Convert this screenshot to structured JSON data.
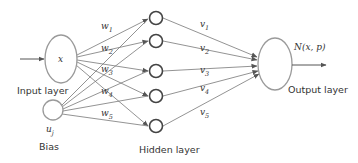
{
  "diagram": {
    "type": "neural-network",
    "input_layer": {
      "node_label": "x",
      "caption": "Input layer"
    },
    "bias": {
      "node_label": "u",
      "node_subscript": "j",
      "caption": "Bias"
    },
    "hidden_layer": {
      "caption": "Hidden layer",
      "node_count": 5
    },
    "output_layer": {
      "node_label": "N(x, p)",
      "caption": "Output layer"
    },
    "input_weights": [
      {
        "base": "w",
        "sub": "1"
      },
      {
        "base": "w",
        "sub": "2"
      },
      {
        "base": "w",
        "sub": "3"
      },
      {
        "base": "w",
        "sub": "4"
      },
      {
        "base": "w",
        "sub": "5"
      }
    ],
    "output_weights": [
      {
        "base": "v",
        "sub": "1"
      },
      {
        "base": "v",
        "sub": "2"
      },
      {
        "base": "v",
        "sub": "3"
      },
      {
        "base": "v",
        "sub": "4"
      },
      {
        "base": "v",
        "sub": "5"
      }
    ],
    "colors": {
      "node_stroke": "#9a9a9a",
      "hidden_stroke": "#444444",
      "edge": "#666666",
      "text": "#333333"
    }
  }
}
